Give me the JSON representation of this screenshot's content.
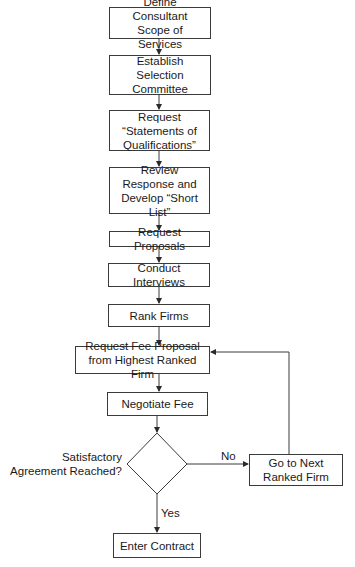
{
  "flowchart": {
    "steps": [
      {
        "id": "define-scope",
        "label": "Define Consultant Scope of Services"
      },
      {
        "id": "establish-committee",
        "label": "Establish Selection Committee"
      },
      {
        "id": "request-soq",
        "label": "Request “Statements of Qualifications”"
      },
      {
        "id": "review-response",
        "label": "Review Response and Develop “Short List”"
      },
      {
        "id": "request-proposals",
        "label": "Request Proposals"
      },
      {
        "id": "conduct-interviews",
        "label": "Conduct Interviews"
      },
      {
        "id": "rank-firms",
        "label": "Rank Firms"
      },
      {
        "id": "request-fee-proposal",
        "label": "Request Fee Proposal from Highest Ranked Firm"
      },
      {
        "id": "negotiate-fee",
        "label": "Negotiate Fee"
      },
      {
        "id": "enter-contract",
        "label": "Enter Contract"
      }
    ],
    "decision": {
      "label": "Satisfactory Agreement Reached?",
      "yes_label": "Yes",
      "no_label": "No"
    },
    "loop_step": {
      "id": "go-to-next",
      "label": "Go to Next Ranked Firm"
    },
    "colors": {
      "stroke": "#3a3a3a",
      "text": "#1a1a1a",
      "background": "#ffffff"
    }
  }
}
